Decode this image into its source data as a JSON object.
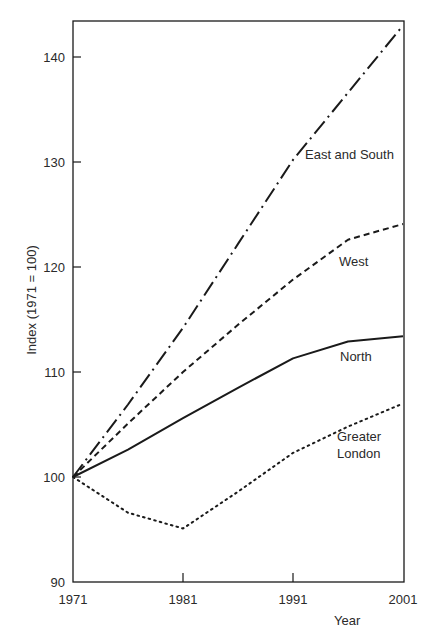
{
  "chart_data": {
    "type": "line",
    "title": "",
    "xlabel": "Year",
    "ylabel": "Index (1971 = 100)",
    "xlim": [
      1971,
      2001
    ],
    "ylim": [
      90,
      143
    ],
    "x_ticks": [
      1971,
      1981,
      1991,
      2001
    ],
    "y_ticks": [
      90,
      100,
      110,
      120,
      130,
      140
    ],
    "grid": false,
    "legend": "inline labels",
    "x": [
      1971,
      1976,
      1981,
      1986,
      1991,
      1996,
      2001
    ],
    "series": [
      {
        "name": "East and South",
        "style": "dash-dot",
        "values": [
          100,
          106.9,
          114.2,
          122.2,
          130.2,
          136.6,
          143.0
        ],
        "label_pos": [
          305,
          159
        ]
      },
      {
        "name": "West",
        "style": "dashed",
        "values": [
          100,
          105.1,
          110.0,
          114.5,
          118.8,
          122.6,
          124.1
        ],
        "label_pos": [
          339,
          266
        ]
      },
      {
        "name": "North",
        "style": "solid",
        "values": [
          100,
          102.6,
          105.6,
          108.5,
          111.3,
          112.9,
          113.4
        ],
        "label_pos": [
          340,
          361
        ]
      },
      {
        "name": "Greater London",
        "style": "dotted",
        "values": [
          100,
          96.6,
          95.1,
          98.6,
          102.3,
          104.8,
          107.0
        ],
        "label_lines": [
          "Greater",
          "London"
        ],
        "label_pos": [
          337,
          441
        ]
      }
    ]
  },
  "layout": {
    "plot_left": 73,
    "plot_right": 404,
    "plot_top": 21,
    "plot_bottom": 582,
    "x_scale_px_per_year": 11.0,
    "y_scale_px_per_unit": 10.5,
    "ink_color": "#1a1a1a"
  }
}
